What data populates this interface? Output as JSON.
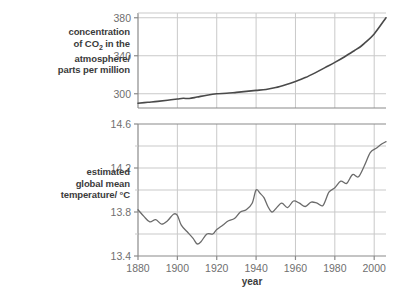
{
  "figure": {
    "xlabel": "year",
    "co2_label_lines": [
      "concentration",
      "of CO2 in the",
      "atmosphere/",
      "parts per million"
    ],
    "co2_label_prefix": "of CO",
    "co2_label_subscript": "2",
    "co2_label_suffix": " in the",
    "temp_label_lines": [
      "estimated",
      "global mean",
      "temperature/ °C"
    ],
    "colors": {
      "line": "#4a4a4a",
      "grid": "#c9c9c9",
      "frame": "#8a8a8a",
      "text": "#3b3b3b",
      "tick_text": "#6f6f6f",
      "background": "#ffffff"
    }
  },
  "chart_data": [
    {
      "type": "line",
      "title": "",
      "panel": "top",
      "xlabel": "year",
      "ylabel": "concentration of CO2 in the atmosphere/ parts per million",
      "xlim": [
        1880,
        2006
      ],
      "ylim": [
        285,
        385
      ],
      "yticks": [
        300,
        340,
        380
      ],
      "xticks": [
        1880,
        1900,
        1920,
        1940,
        1960,
        1980,
        2000
      ],
      "grid": true,
      "legend": "none",
      "series": [
        {
          "name": "CO2 concentration",
          "x": [
            1880,
            1885,
            1890,
            1895,
            1900,
            1903,
            1906,
            1910,
            1915,
            1920,
            1925,
            1930,
            1935,
            1940,
            1945,
            1950,
            1955,
            1960,
            1965,
            1970,
            1975,
            1980,
            1985,
            1990,
            1993,
            1995,
            2000,
            2006
          ],
          "values": [
            290.0,
            291.0,
            292.0,
            293.2,
            294.5,
            295.2,
            295.0,
            296.5,
            298.5,
            300.0,
            300.5,
            301.5,
            302.5,
            303.5,
            304.5,
            306.5,
            309.5,
            313.0,
            317.0,
            322.0,
            327.5,
            333.0,
            339.0,
            345.5,
            349.5,
            353.0,
            363.0,
            380.0
          ]
        }
      ]
    },
    {
      "type": "line",
      "title": "",
      "panel": "bottom",
      "xlabel": "year",
      "ylabel": "estimated global mean temperature/ °C",
      "xlim": [
        1880,
        2006
      ],
      "ylim": [
        13.4,
        14.6
      ],
      "yticks": [
        13.4,
        13.8,
        14.2,
        14.6
      ],
      "yminor": [
        13.6,
        14.0,
        14.4
      ],
      "xticks": [
        1880,
        1900,
        1920,
        1940,
        1960,
        1980,
        2000
      ],
      "grid": true,
      "legend": "none",
      "series": [
        {
          "name": "estimated global mean temperature",
          "x": [
            1880,
            1883,
            1886,
            1889,
            1892,
            1895,
            1898,
            1900,
            1902,
            1905,
            1908,
            1910,
            1912,
            1915,
            1918,
            1920,
            1923,
            1926,
            1929,
            1932,
            1935,
            1938,
            1940,
            1942,
            1944,
            1946,
            1948,
            1950,
            1953,
            1956,
            1959,
            1962,
            1965,
            1968,
            1971,
            1974,
            1977,
            1980,
            1983,
            1986,
            1989,
            1992,
            1995,
            1998,
            2001,
            2004,
            2006
          ],
          "values": [
            13.82,
            13.76,
            13.71,
            13.73,
            13.69,
            13.72,
            13.78,
            13.77,
            13.68,
            13.62,
            13.56,
            13.51,
            13.53,
            13.6,
            13.6,
            13.64,
            13.68,
            13.72,
            13.74,
            13.8,
            13.82,
            13.88,
            14.0,
            13.97,
            13.93,
            13.85,
            13.8,
            13.83,
            13.88,
            13.84,
            13.9,
            13.88,
            13.85,
            13.89,
            13.88,
            13.86,
            13.98,
            14.02,
            14.08,
            14.06,
            14.14,
            14.12,
            14.22,
            14.34,
            14.38,
            14.42,
            14.44
          ]
        }
      ]
    }
  ]
}
